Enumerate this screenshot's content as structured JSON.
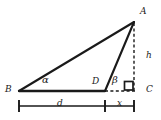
{
  "figure": {
    "type": "geometry-diagram",
    "background_color": "#ffffff",
    "stroke_color": "#1a1a1a"
  },
  "vertices": [
    {
      "id": "A",
      "label": "A",
      "x": 134,
      "y": 22,
      "label_x": 140,
      "label_y": 7
    },
    {
      "id": "B",
      "label": "B",
      "x": 19,
      "y": 91,
      "label_x": 5,
      "label_y": 84
    },
    {
      "id": "C",
      "label": "C",
      "x": 134,
      "y": 91,
      "label_x": 146,
      "label_y": 85
    },
    {
      "id": "D",
      "label": "D",
      "x": 105,
      "y": 91,
      "label_x": 92,
      "label_y": 76
    }
  ],
  "segments": [
    {
      "id": "BA",
      "from": "B",
      "to": "A",
      "style": "solid",
      "width": 2.1
    },
    {
      "id": "DA",
      "from": "D",
      "to": "A",
      "style": "solid",
      "width": 2.1
    },
    {
      "id": "BD",
      "from": "B",
      "to": "D",
      "style": "solid",
      "width": 2.1
    },
    {
      "id": "DC",
      "from": "D",
      "to": "C",
      "style": "dashed",
      "width": 1.3
    },
    {
      "id": "AC",
      "from": "A",
      "to": "C",
      "style": "dashed",
      "width": 1.3
    }
  ],
  "angles": [
    {
      "id": "alpha",
      "label": "α",
      "at": "B",
      "label_x": 43,
      "label_y": 76
    },
    {
      "id": "beta",
      "label": "β",
      "at": "D",
      "label_x": 112,
      "label_y": 75
    }
  ],
  "right_angle": {
    "at": "C",
    "label": "right-angle-marker",
    "x": 124,
    "y": 81,
    "size": 9
  },
  "dimensions": [
    {
      "id": "d",
      "label": "d",
      "from_x": 19,
      "to_x": 105,
      "y": 106,
      "label_x": 58,
      "label_y": 99
    },
    {
      "id": "x",
      "label": "x",
      "from_x": 105,
      "to_x": 134,
      "y": 106,
      "label_x": 117,
      "label_y": 99
    },
    {
      "id": "h",
      "label": "h",
      "orientation": "vertical",
      "x": 134,
      "from_y": 22,
      "to_y": 91,
      "label_x": 146,
      "label_y": 51
    }
  ]
}
